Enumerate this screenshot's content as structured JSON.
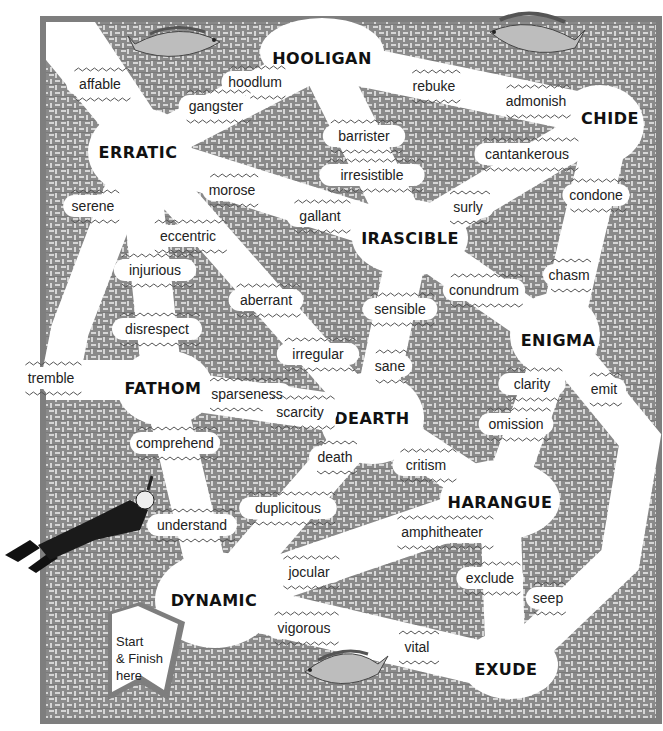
{
  "puzzle": {
    "type": "word-maze",
    "start_label": [
      "Start",
      "& Finish",
      "here"
    ]
  },
  "colors": {
    "background_weave": "#8c8c8c",
    "weave_light": "#d8d8d8",
    "paths": "#ffffff",
    "text": "#111111"
  },
  "nodes": [
    {
      "id": "hooligan",
      "label": "HOOLIGAN",
      "x": 322,
      "y": 58
    },
    {
      "id": "erratic",
      "label": "ERRATIC",
      "x": 138,
      "y": 152
    },
    {
      "id": "chide",
      "label": "CHIDE",
      "x": 610,
      "y": 118
    },
    {
      "id": "irascible",
      "label": "IRASCIBLE",
      "x": 410,
      "y": 238
    },
    {
      "id": "enigma",
      "label": "ENIGMA",
      "x": 558,
      "y": 340
    },
    {
      "id": "fathom",
      "label": "FATHOM",
      "x": 163,
      "y": 388
    },
    {
      "id": "dearth",
      "label": "DEARTH",
      "x": 372,
      "y": 418
    },
    {
      "id": "harangue",
      "label": "HARANGUE",
      "x": 500,
      "y": 502
    },
    {
      "id": "dynamic",
      "label": "DYNAMIC",
      "x": 214,
      "y": 600
    },
    {
      "id": "exude",
      "label": "EXUDE",
      "x": 506,
      "y": 669
    }
  ],
  "clues": [
    {
      "text": "affable",
      "x": 100,
      "y": 84
    },
    {
      "text": "hoodlum",
      "x": 255,
      "y": 82
    },
    {
      "text": "gangster",
      "x": 216,
      "y": 106
    },
    {
      "text": "rebuke",
      "x": 434,
      "y": 86
    },
    {
      "text": "admonish",
      "x": 536,
      "y": 101
    },
    {
      "text": "barrister",
      "x": 364,
      "y": 136
    },
    {
      "text": "cantankerous",
      "x": 527,
      "y": 154
    },
    {
      "text": "irresistible",
      "x": 372,
      "y": 175
    },
    {
      "text": "morose",
      "x": 232,
      "y": 190
    },
    {
      "text": "serene",
      "x": 93,
      "y": 206
    },
    {
      "text": "surly",
      "x": 468,
      "y": 207
    },
    {
      "text": "condone",
      "x": 596,
      "y": 195
    },
    {
      "text": "gallant",
      "x": 320,
      "y": 216
    },
    {
      "text": "eccentric",
      "x": 188,
      "y": 236
    },
    {
      "text": "injurious",
      "x": 155,
      "y": 270
    },
    {
      "text": "chasm",
      "x": 569,
      "y": 275
    },
    {
      "text": "conundrum",
      "x": 484,
      "y": 290
    },
    {
      "text": "aberrant",
      "x": 266,
      "y": 300
    },
    {
      "text": "sensible",
      "x": 400,
      "y": 309
    },
    {
      "text": "disrespect",
      "x": 157,
      "y": 329
    },
    {
      "text": "irregular",
      "x": 318,
      "y": 354
    },
    {
      "text": "sane",
      "x": 390,
      "y": 366
    },
    {
      "text": "tremble",
      "x": 51,
      "y": 378
    },
    {
      "text": "sparseness",
      "x": 247,
      "y": 394
    },
    {
      "text": "clarity",
      "x": 532,
      "y": 384
    },
    {
      "text": "emit",
      "x": 604,
      "y": 389
    },
    {
      "text": "scarcity",
      "x": 300,
      "y": 412
    },
    {
      "text": "omission",
      "x": 516,
      "y": 424
    },
    {
      "text": "comprehend",
      "x": 175,
      "y": 443
    },
    {
      "text": "death",
      "x": 335,
      "y": 457
    },
    {
      "text": "critism",
      "x": 426,
      "y": 465
    },
    {
      "text": "duplicitous",
      "x": 288,
      "y": 508
    },
    {
      "text": "understand",
      "x": 192,
      "y": 525
    },
    {
      "text": "amphitheater",
      "x": 442,
      "y": 532
    },
    {
      "text": "jocular",
      "x": 309,
      "y": 572
    },
    {
      "text": "exclude",
      "x": 490,
      "y": 578
    },
    {
      "text": "seep",
      "x": 548,
      "y": 598
    },
    {
      "text": "vigorous",
      "x": 304,
      "y": 628
    },
    {
      "text": "vital",
      "x": 417,
      "y": 647
    }
  ],
  "decorations": [
    {
      "name": "fish-top-left",
      "x": 180,
      "y": 45
    },
    {
      "name": "fish-top-right",
      "x": 520,
      "y": 35
    },
    {
      "name": "fish-bottom",
      "x": 340,
      "y": 665
    },
    {
      "name": "snorkel-diver",
      "x": 70,
      "y": 520
    }
  ]
}
